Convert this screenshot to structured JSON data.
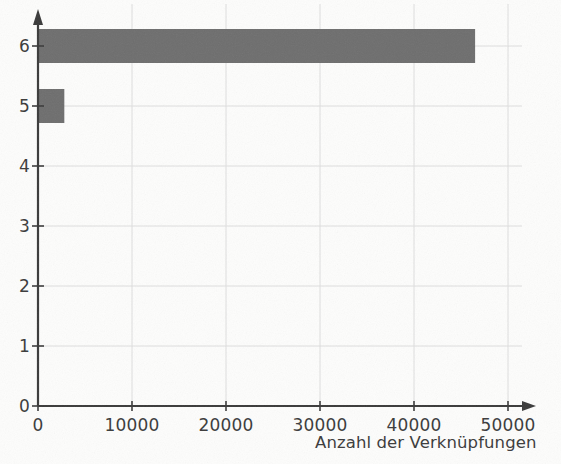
{
  "chart_data": {
    "type": "bar",
    "orientation": "horizontal",
    "title": "",
    "subtitle": "",
    "xlabel": "Anzahl der Verknüpfungen",
    "ylabel": "",
    "categories": [
      "0",
      "1",
      "2",
      "3",
      "4",
      "5",
      "6"
    ],
    "x": [
      0,
      1,
      2,
      3,
      4,
      5,
      6
    ],
    "values": [
      0,
      0,
      0,
      0,
      0,
      2800,
      46500
    ],
    "series": [
      {
        "name": "Anzahl der Verknüpfungen",
        "values": [
          0,
          0,
          0,
          0,
          0,
          2800,
          46500
        ]
      }
    ],
    "bars": [
      {
        "category": "6",
        "value": 46500
      },
      {
        "category": "5",
        "value": 2800
      }
    ],
    "xlim": [
      0,
      53000
    ],
    "ylim": [
      0,
      6.6
    ],
    "xticks": [
      0,
      10000,
      20000,
      30000,
      40000,
      50000
    ],
    "xtick_labels": [
      "0",
      "10000",
      "20000",
      "30000",
      "40000",
      "50000"
    ],
    "yticks": [
      0,
      1,
      2,
      3,
      4,
      5,
      6
    ],
    "ytick_labels": [
      "0",
      "1",
      "2",
      "3",
      "4",
      "5",
      "6"
    ],
    "grid": true,
    "grid_axes": "both",
    "legend": false,
    "legend_position": "none",
    "annotations": [],
    "colors": {
      "bar_fill": "#6e6e6e",
      "axis_line": "#3a3a3a",
      "grid_line": "#dedede",
      "tick_text": "#3f3f3f",
      "background": "#fdfdfc"
    }
  },
  "axes": {
    "x_axis_name": "x-axis",
    "y_axis_name": "y-axis",
    "x_arrow": "arrow-right",
    "y_arrow": "arrow-up"
  }
}
